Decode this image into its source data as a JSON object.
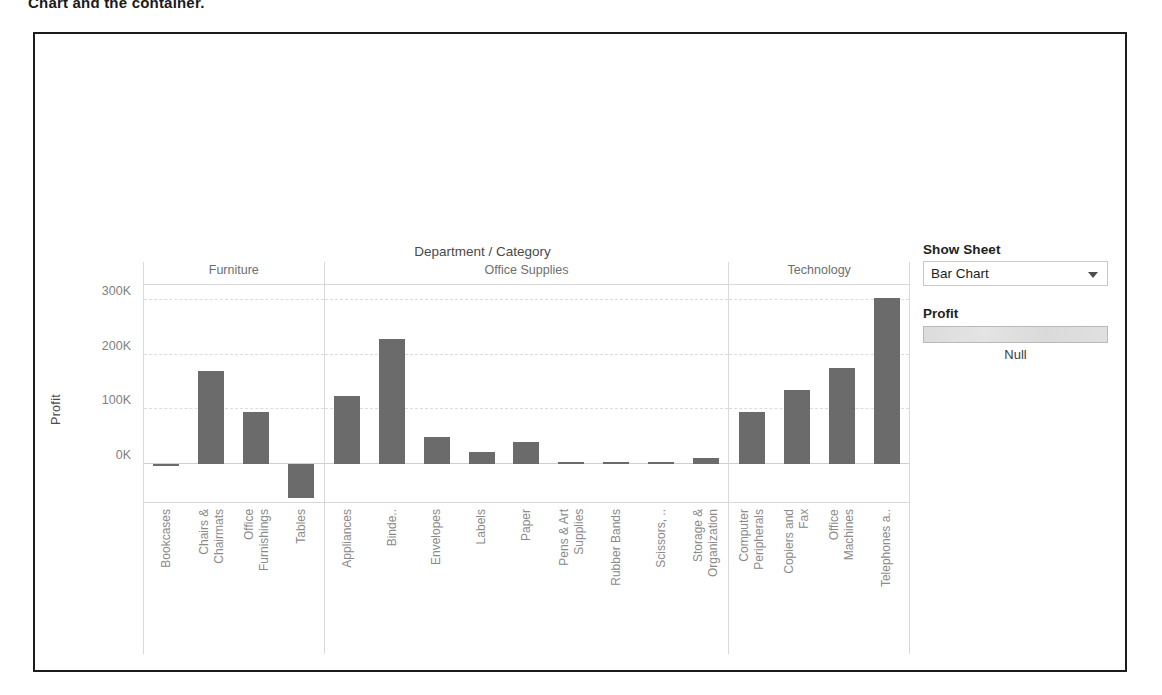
{
  "page": {
    "top_cut_text": "Chart and the container."
  },
  "annotations": [
    {
      "id": "bar-chart-visible",
      "text": "Bar Chart visible"
    },
    {
      "id": "map-collapsed",
      "text": "Map\ncollapsed"
    }
  ],
  "dashboard": {
    "chart": {
      "title": "Department / Category",
      "y_axis_title": "Profit"
    },
    "controls": {
      "show_sheet_label": "Show Sheet",
      "show_sheet_value": "Bar Chart",
      "dropdown_icon": "chevron-down-icon",
      "legend_title": "Profit",
      "legend_null_label": "Null"
    }
  },
  "chart_data": {
    "type": "bar",
    "title": "Department / Category",
    "xlabel": "",
    "ylabel": "Profit",
    "ylim": [
      -70000,
      330000
    ],
    "yticks": [
      0,
      100000,
      200000,
      300000
    ],
    "ytick_labels": [
      "0K",
      "100K",
      "200K",
      "300K"
    ],
    "grid": true,
    "legend_position": "right",
    "panels": [
      {
        "name": "Furniture",
        "categories": [
          "Bookcases",
          "Chairs &\nChairmats",
          "Office\nFurnishings",
          "Tables"
        ],
        "values": [
          -3000,
          170000,
          95000,
          -62000
        ]
      },
      {
        "name": "Office Supplies",
        "categories": [
          "Appliances",
          "Binde..",
          "Envelopes",
          "Labels",
          "Paper",
          "Pens & Art\nSupplies",
          "Rubber Bands",
          "Scissors, ..",
          "Storage &\nOrganization"
        ],
        "values": [
          125000,
          230000,
          50000,
          22000,
          40000,
          3000,
          1500,
          2000,
          10000
        ]
      },
      {
        "name": "Technology",
        "categories": [
          "Computer\nPeripherals",
          "Copiers and\nFax",
          "Office\nMachines",
          "Telephones a.."
        ],
        "values": [
          95000,
          135000,
          175000,
          305000
        ]
      }
    ]
  }
}
